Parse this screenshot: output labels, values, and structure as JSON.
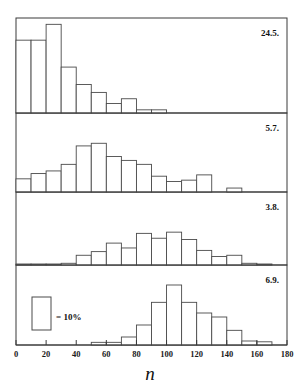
{
  "figure": {
    "axis_symbol": "n",
    "legend": {
      "label": "= 10%",
      "swatch_name": "legend-swatch"
    }
  },
  "chart_data": {
    "type": "bar",
    "title": "",
    "xlabel": "n",
    "ylabel": "",
    "xlim": [
      0,
      180
    ],
    "ylim": [
      0,
      30
    ],
    "grid": false,
    "legend_position": "bottom-left",
    "bin_width": 10,
    "unit": "percent",
    "note": "Four stacked frequency histograms (percent per 10-unit class) labelled by date.",
    "xticks": [
      0,
      20,
      40,
      60,
      80,
      100,
      120,
      140,
      160,
      180
    ],
    "xticklabels": [
      "0",
      "20",
      "40",
      "60",
      "80",
      "100",
      "120",
      "140",
      "160",
      "180"
    ],
    "panels": [
      {
        "label": "24.5.",
        "bin_starts": [
          0,
          10,
          20,
          30,
          40,
          50,
          60,
          70,
          80,
          90,
          100
        ],
        "values": [
          23.0,
          23.0,
          28.0,
          14.5,
          9.0,
          6.5,
          3.0,
          4.5,
          1.0,
          1.0,
          0.0
        ]
      },
      {
        "label": "5.7.",
        "bin_starts": [
          0,
          10,
          20,
          30,
          40,
          50,
          60,
          70,
          80,
          90,
          100,
          110,
          120,
          130,
          140,
          150,
          160
        ],
        "values": [
          5.0,
          7.0,
          8.0,
          10.5,
          17.5,
          18.5,
          13.5,
          12.0,
          10.5,
          6.0,
          4.0,
          4.5,
          6.5,
          0.0,
          1.5,
          0.0,
          0.0
        ]
      },
      {
        "label": "3.8.",
        "bin_starts": [
          0,
          10,
          20,
          30,
          40,
          50,
          60,
          70,
          80,
          90,
          100,
          110,
          120,
          130,
          140,
          150,
          160,
          170
        ],
        "values": [
          0.3,
          0.3,
          0.3,
          0.7,
          4.0,
          5.5,
          9.0,
          7.0,
          13.0,
          11.0,
          13.5,
          10.5,
          6.0,
          3.5,
          4.0,
          0.7,
          0.3,
          0.0
        ]
      },
      {
        "label": "6.9.",
        "bin_starts": [
          0,
          10,
          20,
          30,
          40,
          50,
          60,
          70,
          80,
          90,
          100,
          110,
          120,
          130,
          140,
          150,
          160,
          170
        ],
        "values": [
          0.0,
          0.0,
          0.0,
          0.0,
          0.0,
          1.0,
          1.0,
          3.0,
          7.5,
          16.0,
          22.5,
          16.0,
          12.0,
          10.5,
          5.5,
          1.5,
          1.2,
          0.0
        ]
      }
    ]
  }
}
